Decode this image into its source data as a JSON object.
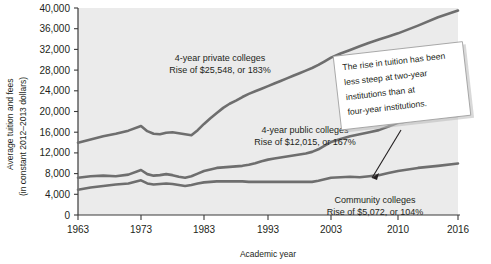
{
  "chart_data": {
    "type": "line",
    "title": "",
    "xlabel": "Academic year",
    "ylabel_line1": "Average tuition and fees",
    "ylabel_line2": "(in constant 2012–2013 dollars)",
    "grid": false,
    "legend_position": "inline-annotations",
    "xlim": [
      1963,
      2016
    ],
    "ylim": [
      0,
      40000
    ],
    "xticks": [
      1963,
      1973,
      1983,
      1993,
      2003,
      2010,
      2016
    ],
    "xtick_labels": [
      "1963",
      "1973",
      "1983",
      "1993",
      "2003",
      "2010",
      "2016"
    ],
    "yticks": [
      0,
      4000,
      8000,
      12000,
      16000,
      20000,
      24000,
      28000,
      32000,
      36000,
      40000
    ],
    "ytick_labels": [
      "0",
      "4,000",
      "8,000",
      "12,000",
      "16,000",
      "20,000",
      "24,000",
      "28,000",
      "32,000",
      "36,000",
      "40,000"
    ],
    "series": [
      {
        "name": "4-year private colleges",
        "color": "#6e6e6e",
        "x": [
          1963,
          1965,
          1967,
          1969,
          1971,
          1973,
          1974,
          1975,
          1976,
          1977,
          1978,
          1979,
          1980,
          1981,
          1982,
          1983,
          1984,
          1985,
          1986,
          1987,
          1988,
          1989,
          1990,
          1991,
          1992,
          1993,
          1994,
          1995,
          1996,
          1997,
          1998,
          1999,
          2000,
          2001,
          2002,
          2003,
          2004,
          2005,
          2006,
          2007,
          2008,
          2009,
          2010,
          2012,
          2014,
          2016
        ],
        "y": [
          13960,
          14600,
          15200,
          15700,
          16300,
          17200,
          16200,
          15700,
          15600,
          15900,
          16000,
          15800,
          15600,
          15400,
          16400,
          17600,
          18700,
          19700,
          20700,
          21500,
          22100,
          22800,
          23400,
          23900,
          24400,
          24900,
          25400,
          25900,
          26400,
          26900,
          27400,
          27900,
          28400,
          29000,
          29700,
          30400,
          31200,
          31900,
          32600,
          33300,
          33900,
          34500,
          35100,
          36600,
          38200,
          39508
        ]
      },
      {
        "name": "4-year public colleges",
        "color": "#6e6e6e",
        "x": [
          1963,
          1965,
          1967,
          1969,
          1971,
          1973,
          1974,
          1975,
          1976,
          1977,
          1978,
          1979,
          1980,
          1981,
          1982,
          1983,
          1984,
          1985,
          1986,
          1987,
          1988,
          1989,
          1990,
          1991,
          1992,
          1993,
          1994,
          1995,
          1996,
          1997,
          1998,
          1999,
          2000,
          2001,
          2002,
          2003,
          2004,
          2005,
          2006,
          2007,
          2008,
          2009,
          2010,
          2012,
          2014,
          2016
        ],
        "y": [
          7190,
          7500,
          7600,
          7500,
          7800,
          8700,
          7900,
          7600,
          7700,
          7900,
          7700,
          7400,
          7200,
          7500,
          8000,
          8500,
          8800,
          9100,
          9200,
          9300,
          9400,
          9500,
          9700,
          10000,
          10400,
          10700,
          10900,
          11100,
          11300,
          11500,
          11700,
          11900,
          12200,
          12700,
          13400,
          14100,
          14700,
          15200,
          15600,
          16000,
          16400,
          17100,
          17800,
          18500,
          18900,
          19205
        ]
      },
      {
        "name": "Community colleges",
        "color": "#6e6e6e",
        "x": [
          1963,
          1965,
          1967,
          1969,
          1971,
          1973,
          1974,
          1975,
          1976,
          1977,
          1978,
          1979,
          1980,
          1981,
          1982,
          1983,
          1984,
          1985,
          1986,
          1987,
          1988,
          1989,
          1990,
          1991,
          1992,
          1993,
          1994,
          1995,
          1996,
          1997,
          1998,
          1999,
          2000,
          2001,
          2002,
          2003,
          2004,
          2005,
          2006,
          2007,
          2008,
          2009,
          2010,
          2012,
          2014,
          2016
        ],
        "y": [
          4880,
          5300,
          5600,
          5900,
          6100,
          6700,
          6100,
          5900,
          6000,
          6100,
          6000,
          5800,
          5600,
          5800,
          6100,
          6300,
          6400,
          6500,
          6500,
          6500,
          6500,
          6500,
          6400,
          6400,
          6400,
          6400,
          6400,
          6400,
          6400,
          6400,
          6400,
          6400,
          6400,
          6600,
          6900,
          7200,
          7300,
          7400,
          7300,
          7500,
          7700,
          8100,
          8500,
          9100,
          9500,
          9952
        ]
      }
    ],
    "annotations": [
      {
        "id": "private-label",
        "line1": "4-year private colleges",
        "line2": "Rise of $25,548, or 183%"
      },
      {
        "id": "public-label",
        "line1": "4-year public colleges",
        "line2": "Rise of $12,015, or 167%"
      },
      {
        "id": "community-label",
        "line1": "Community colleges",
        "line2": "Rise of $5,072, or 104%"
      }
    ],
    "callout": {
      "lines": [
        "The rise in tuition has been",
        "less steep at two-year",
        "institutions than at",
        "four-year institutions."
      ]
    }
  },
  "colors": {
    "plot_background": "#ebebeb",
    "line": "#6e6e6e",
    "axis": "#3a3a3a",
    "text": "#231f20",
    "callout_fill": "#ffffff"
  }
}
